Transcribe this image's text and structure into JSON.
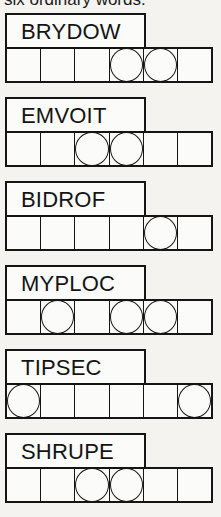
{
  "intro_text": "six ordinary words.",
  "puzzles": [
    {
      "scramble": "BRYDOW",
      "cells": 6,
      "circled": [
        4,
        5
      ]
    },
    {
      "scramble": "EMVOIT",
      "cells": 6,
      "circled": [
        3,
        4
      ]
    },
    {
      "scramble": "BIDROF",
      "cells": 6,
      "circled": [
        5
      ]
    },
    {
      "scramble": "MYPLOC",
      "cells": 6,
      "circled": [
        2,
        4,
        5
      ]
    },
    {
      "scramble": "TIPSEC",
      "cells": 6,
      "circled": [
        1,
        6
      ]
    },
    {
      "scramble": "SHRUPE",
      "cells": 6,
      "circled": [
        3,
        4
      ]
    }
  ]
}
